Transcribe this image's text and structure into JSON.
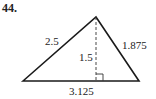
{
  "problem": {
    "number": "44."
  },
  "diagram": {
    "type": "triangle-with-altitude",
    "vertices": {
      "left": [
        23,
        81
      ],
      "apex": [
        96,
        17
      ],
      "right": [
        139,
        81
      ]
    },
    "labels": {
      "left_side": "2.5",
      "right_side": "1.875",
      "base": "3.125",
      "height": "1.5"
    },
    "colors": {
      "stroke": "#1a1a1a"
    }
  }
}
